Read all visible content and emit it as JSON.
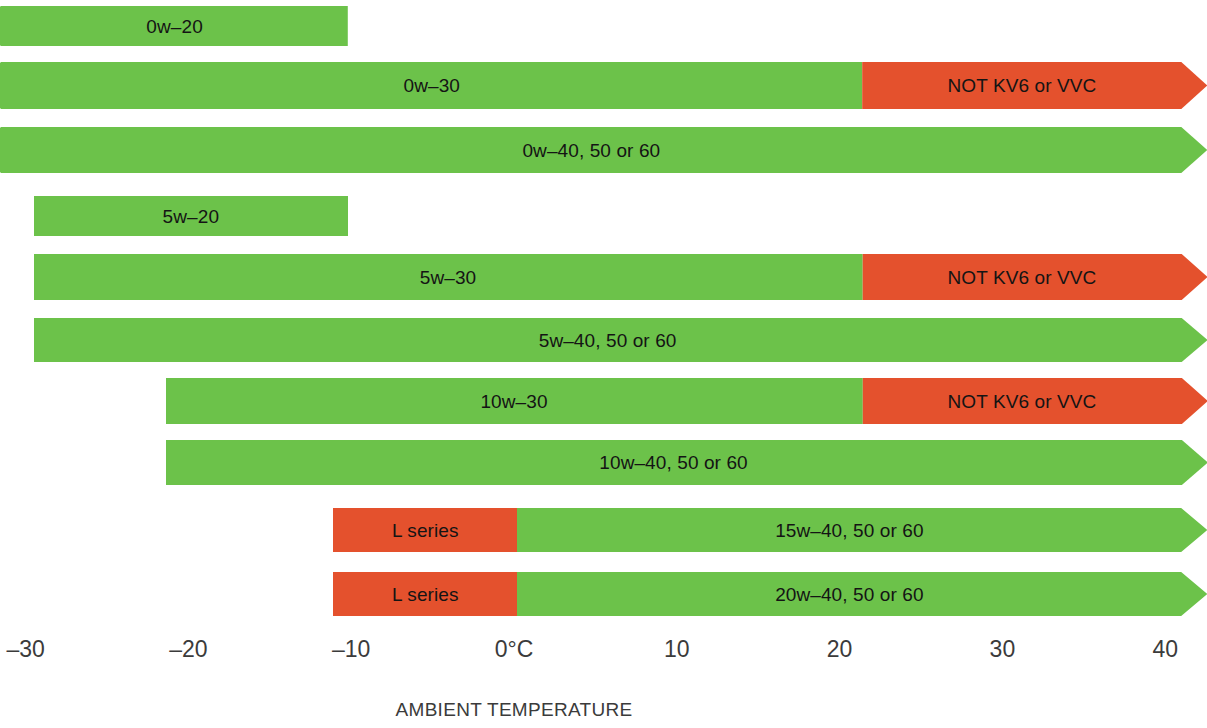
{
  "figure": {
    "axis_title": "AMBIENT TEMPERATURE",
    "axis_ticks": [
      {
        "label": "–30",
        "value": -30
      },
      {
        "label": "–20",
        "value": -20
      },
      {
        "label": "–10",
        "value": -10
      },
      {
        "label": "0°C",
        "value": 0
      },
      {
        "label": "10",
        "value": 10
      },
      {
        "label": "20",
        "value": 20
      },
      {
        "label": "30",
        "value": 30
      },
      {
        "label": "40",
        "value": 40
      }
    ],
    "colors": {
      "green": "#6cc24a",
      "red": "#e4512d",
      "text": "#141414",
      "axis_text": "#3b3b3b"
    }
  },
  "chart_data": {
    "type": "bar",
    "title": "",
    "xlabel": "AMBIENT TEMPERATURE",
    "ylabel": "",
    "xlim": [
      -31.5,
      41
    ],
    "grid": false,
    "legend": "none",
    "orientation": "horizontal",
    "categories": [
      "0w–20",
      "0w–30",
      "0w–40, 50 or 60",
      "5w–20",
      "5w–30",
      "5w–40, 50 or 60",
      "10w–30",
      "10w–40, 50 or 60",
      "15w–40, 50 or 60",
      "20w–40, 50 or 60"
    ],
    "bars": [
      {
        "name": "0w–20",
        "start": -31.5,
        "end": -10.2,
        "arrow_left": true,
        "arrow_right": false,
        "segments": [
          {
            "label": "0w–20",
            "from": -31.5,
            "to": -10.2,
            "color": "green"
          }
        ]
      },
      {
        "name": "0w–30",
        "start": -31.5,
        "end": 41,
        "arrow_left": true,
        "arrow_right": true,
        "segments": [
          {
            "label": "0w–30",
            "from": -31.5,
            "to": 21.4,
            "color": "green"
          },
          {
            "label": "NOT KV6 or VVC",
            "from": 21.4,
            "to": 41,
            "color": "red"
          }
        ]
      },
      {
        "name": "0w–40, 50 or 60",
        "start": -31.5,
        "end": 41,
        "arrow_left": true,
        "arrow_right": true,
        "segments": [
          {
            "label": "0w–40, 50 or 60",
            "from": -31.5,
            "to": 41,
            "color": "green"
          }
        ]
      },
      {
        "name": "5w–20",
        "start": -29.5,
        "end": -10.2,
        "arrow_left": false,
        "arrow_right": false,
        "segments": [
          {
            "label": "5w–20",
            "from": -29.5,
            "to": -10.2,
            "color": "green"
          }
        ]
      },
      {
        "name": "5w–30",
        "start": -29.5,
        "end": 41,
        "arrow_left": false,
        "arrow_right": true,
        "segments": [
          {
            "label": "5w–30",
            "from": -29.5,
            "to": 21.4,
            "color": "green"
          },
          {
            "label": "NOT KV6 or VVC",
            "from": 21.4,
            "to": 41,
            "color": "red"
          }
        ]
      },
      {
        "name": "5w–40, 50 or 60",
        "start": -29.5,
        "end": 41,
        "arrow_left": false,
        "arrow_right": true,
        "segments": [
          {
            "label": "5w–40, 50 or 60",
            "from": -29.5,
            "to": 41,
            "color": "green"
          }
        ]
      },
      {
        "name": "10w–30",
        "start": -21.4,
        "end": 41,
        "arrow_left": false,
        "arrow_right": true,
        "segments": [
          {
            "label": "10w–30",
            "from": -21.4,
            "to": 21.4,
            "color": "green"
          },
          {
            "label": "NOT KV6 or VVC",
            "from": 21.4,
            "to": 41,
            "color": "red"
          }
        ]
      },
      {
        "name": "10w–40, 50 or 60",
        "start": -21.4,
        "end": 41,
        "arrow_left": false,
        "arrow_right": true,
        "segments": [
          {
            "label": "10w–40, 50 or 60",
            "from": -21.4,
            "to": 41,
            "color": "green"
          }
        ]
      },
      {
        "name": "15w–40, 50 or 60",
        "start": -11.1,
        "end": 41,
        "arrow_left": false,
        "arrow_right": true,
        "segments": [
          {
            "label": "L series",
            "from": -11.1,
            "to": 0.2,
            "color": "red"
          },
          {
            "label": "15w–40, 50 or 60",
            "from": 0.2,
            "to": 41,
            "color": "green"
          }
        ]
      },
      {
        "name": "20w–40, 50 or 60",
        "start": -11.1,
        "end": 41,
        "arrow_left": false,
        "arrow_right": true,
        "segments": [
          {
            "label": "L series",
            "from": -11.1,
            "to": 0.2,
            "color": "red"
          },
          {
            "label": "20w–40, 50 or 60",
            "from": 0.2,
            "to": 41,
            "color": "green"
          }
        ]
      }
    ]
  }
}
